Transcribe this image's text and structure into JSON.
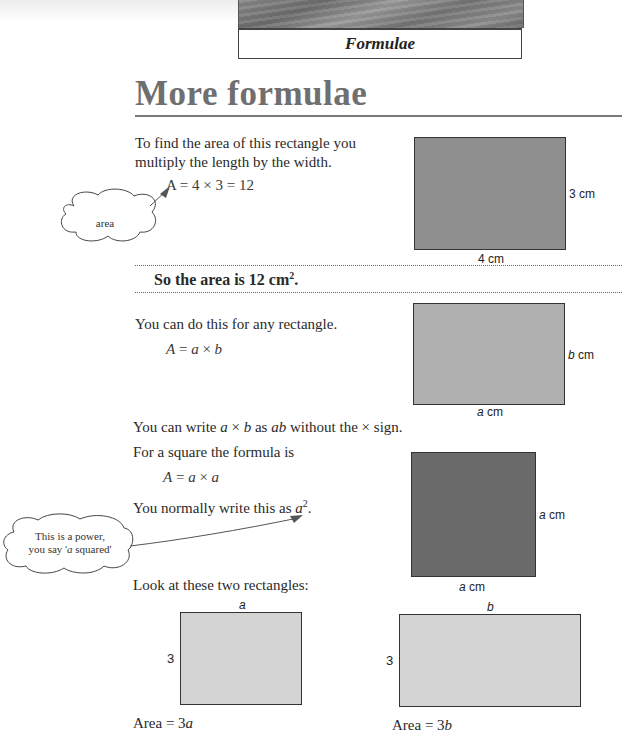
{
  "header": {
    "chapter_title": "Formulae"
  },
  "page": {
    "title": "More formulae"
  },
  "section1": {
    "intro_line1": "To find the area of this rectangle you",
    "intro_line2": "multiply the length by the width.",
    "formula": "A = 4 × 3 = 12",
    "callout": "area",
    "conclusion": "So the area is 12 cm",
    "conclusion_sup": "2",
    "conclusion_end": ".",
    "diagram": {
      "side_label": "3 cm",
      "bottom_label": "4 cm",
      "fill": "#8f8f8f"
    }
  },
  "section2": {
    "intro": "You can do this for any rectangle.",
    "formula_a": "A",
    "formula_eq": " = ",
    "formula_x": "a",
    "formula_times": " × ",
    "formula_y": "b",
    "diagram": {
      "side_var": "b",
      "side_unit": " cm",
      "bottom_var": "a",
      "bottom_unit": " cm",
      "fill": "#b0b0b0"
    },
    "note_pre": "You can write ",
    "note_a": "a",
    "note_times": " × ",
    "note_b": "b",
    "note_as": " as ",
    "note_ab": "ab",
    "note_post": " without the × sign."
  },
  "section3": {
    "intro": "For a square the formula is",
    "formula_a": "A",
    "formula_rest_eq": " = ",
    "formula_x": "a",
    "formula_times": " × ",
    "formula_y": "a",
    "normal_pre": "You normally write this as ",
    "normal_var": "a",
    "normal_sup": "2",
    "normal_end": ".",
    "callout_line1": "This is a power,",
    "callout_line2_pre": "you say '",
    "callout_line2_var": "a",
    "callout_line2_post": " squared'",
    "diagram": {
      "side_var": "a",
      "side_unit": " cm",
      "bottom_var": "a",
      "bottom_unit": " cm",
      "fill": "#6a6a6a"
    }
  },
  "section4": {
    "intro": "Look at these two rectangles:",
    "rect_left": {
      "top_label": "a",
      "side_label": "3",
      "area_pre": "Area = 3",
      "area_var": "a",
      "fill": "#d4d4d4"
    },
    "rect_right": {
      "top_label": "b",
      "side_label": "3",
      "area_pre": "Area = 3",
      "area_var": "b",
      "fill": "#d4d4d4"
    }
  }
}
